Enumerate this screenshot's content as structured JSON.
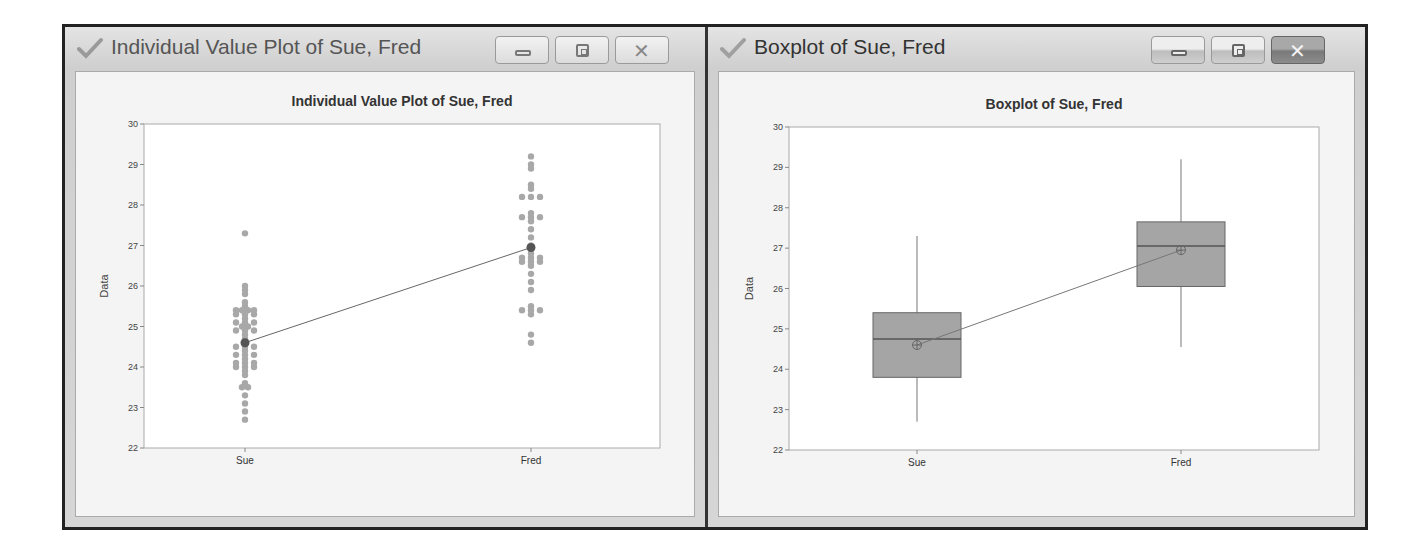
{
  "windows": [
    {
      "title": "Individual Value Plot of Sue, Fred",
      "buttons": {
        "minimize": "minimize",
        "maximize": "maximize",
        "close": "close"
      }
    },
    {
      "title": "Boxplot of Sue, Fred",
      "buttons": {
        "minimize": "minimize",
        "maximize": "maximize",
        "close": "close"
      }
    }
  ],
  "chart_data": [
    {
      "type": "scatter",
      "title": "Individual Value Plot of Sue, Fred",
      "xlabel": "",
      "ylabel": "Data",
      "categories": [
        "Sue",
        "Fred"
      ],
      "yticks": [
        "22",
        "23",
        "24",
        "25",
        "26",
        "27",
        "28",
        "29",
        "30"
      ],
      "ylim": [
        22,
        30
      ],
      "grid": false,
      "series": [
        {
          "name": "Sue",
          "values": [
            22.7,
            22.9,
            23.1,
            23.3,
            23.5,
            23.5,
            23.6,
            23.8,
            23.9,
            24.0,
            24.1,
            24.2,
            24.3,
            24.4,
            24.5,
            24.6,
            24.7,
            24.8,
            24.9,
            25.0,
            25.0,
            25.1,
            25.2,
            25.3,
            25.4,
            25.4,
            25.5,
            25.6,
            25.8,
            25.9,
            26.0,
            27.3
          ]
        },
        {
          "name": "Fred",
          "values": [
            24.6,
            24.8,
            25.3,
            25.4,
            25.5,
            25.9,
            26.1,
            26.3,
            26.5,
            26.6,
            26.7,
            26.8,
            26.9,
            27.0,
            27.2,
            27.4,
            27.6,
            27.7,
            27.8,
            28.2,
            28.4,
            28.5,
            28.9,
            29.0,
            29.2
          ]
        }
      ],
      "means": {
        "Sue": 24.6,
        "Fred": 26.95
      }
    },
    {
      "type": "box",
      "title": "Boxplot of Sue, Fred",
      "xlabel": "",
      "ylabel": "Data",
      "categories": [
        "Sue",
        "Fred"
      ],
      "yticks": [
        "22",
        "23",
        "24",
        "25",
        "26",
        "27",
        "28",
        "29",
        "30"
      ],
      "ylim": [
        22,
        30
      ],
      "grid": false,
      "boxes": [
        {
          "name": "Sue",
          "min": 22.7,
          "q1": 23.8,
          "median": 24.75,
          "q3": 25.4,
          "max": 27.3,
          "mean": 24.6
        },
        {
          "name": "Fred",
          "min": 24.55,
          "q1": 26.05,
          "median": 27.05,
          "q3": 27.65,
          "max": 29.2,
          "mean": 26.95
        }
      ]
    }
  ]
}
